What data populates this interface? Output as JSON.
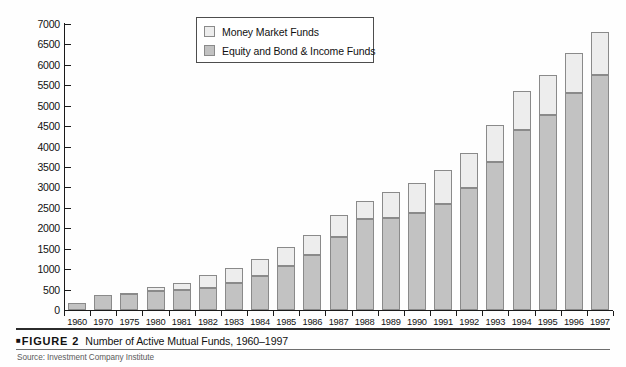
{
  "figure": {
    "marker": "■",
    "label": "FIGURE",
    "number": "2",
    "title": "Number of Active Mutual Funds, 1960–1997",
    "source": "Source: Investment Company Institute"
  },
  "legend": {
    "position": "top-center-inside",
    "entries": [
      {
        "label": "Money Market Funds",
        "color": "#ededed",
        "key": "money_market"
      },
      {
        "label": "Equity and Bond & Income Funds",
        "color": "#c2c2c2",
        "key": "equity_bond"
      }
    ]
  },
  "axes": {
    "y_ticks": [
      "7000",
      "6500",
      "6000",
      "5500",
      "5000",
      "4500",
      "4000",
      "3500",
      "3000",
      "2500",
      "2000",
      "1500",
      "1000",
      "500",
      "0"
    ],
    "y_min": 0,
    "y_max": 7000,
    "y_step": 500,
    "ylabel": "",
    "xlabel": "",
    "grid": false
  },
  "chart_data": {
    "type": "bar",
    "subtype": "stacked-vertical",
    "title": "Number of Active Mutual Funds, 1960–1997",
    "xlabel": "",
    "ylabel": "",
    "ylim": [
      0,
      7000
    ],
    "ytick_step": 500,
    "grid": false,
    "legend": "inside top-center",
    "categories": [
      "1960",
      "1970",
      "1975",
      "1980",
      "1981",
      "1982",
      "1983",
      "1984",
      "1985",
      "1986",
      "1987",
      "1988",
      "1989",
      "1990",
      "1991",
      "1992",
      "1993",
      "1994",
      "1995",
      "1996",
      "1997"
    ],
    "series": [
      {
        "name": "Equity and Bond & Income Funds",
        "color": "#c2c2c2",
        "values": [
          160,
          360,
          390,
          460,
          486,
          539,
          653,
          820,
          1071,
          1356,
          1776,
          2217,
          2253,
          2362,
          2606,
          2985,
          3611,
          4394,
          4764,
          5305,
          5750
        ]
      },
      {
        "name": "Money Market Funds",
        "color": "#ededed",
        "values": [
          0,
          0,
          36,
          106,
          179,
          318,
          373,
          422,
          460,
          485,
          543,
          463,
          625,
          743,
          820,
          868,
          928,
          963,
          997,
          988,
          1050
        ]
      }
    ],
    "totals": [
      160,
      360,
      426,
      566,
      665,
      857,
      1026,
      1242,
      1531,
      1841,
      2319,
      2680,
      2878,
      3105,
      3426,
      3853,
      4539,
      5357,
      5761,
      6293,
      6800
    ]
  }
}
